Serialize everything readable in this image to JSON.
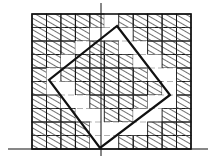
{
  "figure": {
    "stroke_color": "#111111",
    "background_color": "#ffffff",
    "hatch_color": "#222222"
  },
  "geometry": {
    "outer_square": {
      "x": 32,
      "y": 14,
      "width": 159,
      "height": 135
    },
    "grid": {
      "cols": 11,
      "rows": 10
    },
    "baseline": {
      "x1": 8,
      "x2": 208,
      "y": 149
    },
    "vertical_axis": {
      "x": 101,
      "y1": 3,
      "y2": 156
    },
    "rotated_square": [
      [
        117,
        26
      ],
      [
        170,
        95
      ],
      [
        100,
        148
      ],
      [
        49,
        80
      ]
    ]
  },
  "cells": [
    [
      1,
      1,
      1,
      1,
      1,
      0,
      1,
      1,
      1,
      1,
      1
    ],
    [
      1,
      1,
      1,
      1,
      0,
      0,
      0,
      1,
      1,
      1,
      1
    ],
    [
      1,
      1,
      1,
      0,
      1,
      1,
      0,
      0,
      1,
      1,
      1
    ],
    [
      1,
      1,
      0,
      1,
      1,
      1,
      1,
      0,
      0,
      1,
      1
    ],
    [
      1,
      0,
      1,
      1,
      1,
      1,
      1,
      1,
      0,
      0,
      1
    ],
    [
      1,
      0,
      0,
      1,
      1,
      1,
      1,
      1,
      1,
      0,
      1
    ],
    [
      1,
      1,
      0,
      0,
      1,
      1,
      1,
      1,
      0,
      0,
      1
    ],
    [
      1,
      1,
      1,
      0,
      0,
      1,
      1,
      0,
      0,
      1,
      1
    ],
    [
      1,
      1,
      1,
      1,
      0,
      0,
      0,
      0,
      1,
      1,
      1
    ],
    [
      1,
      1,
      1,
      1,
      0,
      0,
      1,
      1,
      1,
      1,
      1
    ]
  ]
}
